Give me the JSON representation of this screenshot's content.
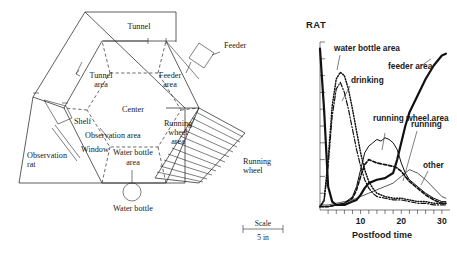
{
  "figure": {
    "apparatus": {
      "labels": {
        "tunnel": "Tunnel",
        "tunnel_area": "Tunnel",
        "tunnel_area2": "area",
        "feeder": "Feeder",
        "feeder_area": "Feeder",
        "feeder_area2": "area",
        "center": "Center",
        "shelf": "Shelf",
        "observation_area": "Observation area",
        "window": "Window",
        "observation_rat": "Observation",
        "observation_rat2": "rat",
        "water_bottle_area": "Water bottle",
        "water_bottle_area2": "area",
        "water_bottle": "Water bottle",
        "running_wheel_area": "Running",
        "running_wheel_area2": "wheel",
        "running_wheel_area3": "area",
        "running_wheel": "Running",
        "running_wheel2": "wheel"
      },
      "scale": {
        "caption": "Scale",
        "value": "5 in"
      }
    },
    "chart_data": {
      "type": "line",
      "title": "RAT",
      "xlabel": "Postfood time",
      "ylabel": "",
      "xlim": [
        0,
        32
      ],
      "ylim": [
        0,
        100
      ],
      "xticks": [
        10,
        20,
        30
      ],
      "xtick_labels": [
        "10",
        "20",
        "30"
      ],
      "yticks_count": 10,
      "ytick_labels": [],
      "grid": false,
      "legend": "inline-annotations",
      "annotations": [
        "water bottle area",
        "drinking",
        "feeder area",
        "running wheel area",
        "running",
        "other"
      ],
      "series": [
        {
          "name": "water bottle area",
          "style": "dotted",
          "x": [
            0,
            1,
            2,
            3,
            4,
            5,
            6,
            7,
            8,
            9,
            10,
            11,
            12,
            13,
            14,
            16,
            18,
            20,
            22,
            24,
            26,
            28,
            30,
            31
          ],
          "values": [
            2,
            6,
            30,
            62,
            78,
            82,
            80,
            72,
            60,
            47,
            34,
            24,
            17,
            13,
            10,
            8,
            7,
            7,
            6,
            5,
            5,
            4,
            4,
            4
          ]
        },
        {
          "name": "drinking",
          "style": "dash-dot",
          "x": [
            0,
            1,
            2,
            3,
            4,
            5,
            6,
            7,
            8,
            9,
            10,
            11,
            12,
            13,
            14,
            16,
            18,
            20,
            22,
            24,
            26,
            28,
            30,
            31
          ],
          "values": [
            2,
            5,
            26,
            56,
            72,
            76,
            70,
            60,
            48,
            36,
            26,
            18,
            13,
            10,
            8,
            7,
            6,
            6,
            5,
            4,
            4,
            3,
            3,
            3
          ]
        },
        {
          "name": "feeder area",
          "style": "solid-thick",
          "x": [
            0,
            1,
            2,
            3,
            4,
            5,
            6,
            7,
            8,
            9,
            10,
            11,
            12,
            14,
            16,
            18,
            19,
            20,
            21,
            22,
            24,
            26,
            28,
            30,
            31
          ],
          "values": [
            96,
            60,
            14,
            5,
            3,
            3,
            3,
            4,
            5,
            6,
            9,
            13,
            16,
            18,
            19,
            22,
            30,
            40,
            50,
            58,
            68,
            78,
            86,
            92,
            93
          ]
        },
        {
          "name": "running wheel area",
          "style": "solid-thin",
          "x": [
            0,
            2,
            4,
            6,
            8,
            9,
            10,
            11,
            12,
            13,
            14,
            15,
            16,
            17,
            18,
            19,
            20,
            21,
            22,
            24,
            26,
            28,
            30,
            31
          ],
          "values": [
            2,
            2,
            3,
            4,
            8,
            14,
            24,
            34,
            38,
            40,
            42,
            41,
            43,
            42,
            40,
            36,
            28,
            22,
            18,
            14,
            10,
            7,
            5,
            5
          ]
        },
        {
          "name": "running",
          "style": "dashed",
          "x": [
            0,
            2,
            4,
            6,
            8,
            9,
            10,
            11,
            12,
            13,
            14,
            16,
            18,
            19,
            20,
            21,
            22,
            24,
            26,
            28,
            30,
            31
          ],
          "values": [
            2,
            2,
            3,
            4,
            7,
            12,
            20,
            27,
            30,
            29,
            28,
            27,
            26,
            25,
            23,
            20,
            17,
            13,
            9,
            6,
            4,
            4
          ]
        },
        {
          "name": "other",
          "style": "solid-light",
          "x": [
            0,
            2,
            4,
            6,
            8,
            10,
            12,
            14,
            16,
            18,
            19,
            20,
            21,
            22,
            23,
            24,
            26,
            28,
            30,
            31
          ],
          "values": [
            3,
            3,
            4,
            5,
            6,
            8,
            10,
            12,
            14,
            16,
            18,
            20,
            22,
            24,
            23,
            22,
            18,
            13,
            8,
            7
          ]
        }
      ]
    }
  }
}
